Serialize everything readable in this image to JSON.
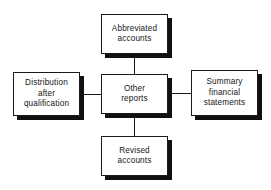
{
  "diagram": {
    "type": "hub-and-spoke",
    "background_color": "#ffffff",
    "line_color": "#1a1a1a",
    "box_fill_color": "#ffffff",
    "box_border_color": "#1a1a1a",
    "shadow_color": "#101010",
    "center": {
      "id": "other-reports",
      "label": "Other\nreports"
    },
    "nodes": [
      {
        "id": "abbreviated-accounts",
        "position": "top",
        "label": "Abbreviated\naccounts"
      },
      {
        "id": "distribution-after-qualification",
        "position": "left",
        "label": "Distribution\nafter\nqualification"
      },
      {
        "id": "summary-financial-statements",
        "position": "right",
        "label": "Summary\nfinancial\nstatements"
      },
      {
        "id": "revised-accounts",
        "position": "bottom",
        "label": "Revised\naccounts"
      }
    ],
    "connections": [
      {
        "from": "other-reports",
        "to": "abbreviated-accounts"
      },
      {
        "from": "other-reports",
        "to": "distribution-after-qualification"
      },
      {
        "from": "other-reports",
        "to": "summary-financial-statements"
      },
      {
        "from": "other-reports",
        "to": "revised-accounts"
      }
    ]
  }
}
